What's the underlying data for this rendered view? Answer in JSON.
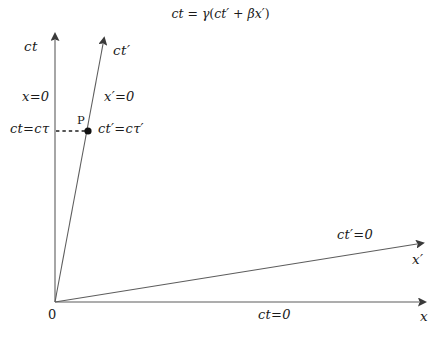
{
  "figure": {
    "title_equation": "ct = γ(ct′ + βx′)",
    "title_parts": {
      "lhs": "ct",
      "equals": "=",
      "gamma": "γ",
      "open": "(",
      "ctp": "ct′",
      "plus": "+",
      "beta": "β",
      "xp": "x′",
      "close": ")"
    },
    "background_color": "#ffffff",
    "line_color": "#555555",
    "text_color": "#1a1a1a"
  },
  "axes": {
    "ct": {
      "label": "ct",
      "region_label": "x=0",
      "origin": [
        55,
        302
      ],
      "tip": [
        55,
        36
      ]
    },
    "ct_prime": {
      "label": "ct′",
      "region_label": "x′=0",
      "origin": [
        55,
        302
      ],
      "tip": [
        104,
        40
      ]
    },
    "x": {
      "label": "x",
      "region_label": "ct=0",
      "origin": [
        55,
        302
      ],
      "tip": [
        428,
        302
      ]
    },
    "x_prime": {
      "label": "x′",
      "region_label": "ct′=0",
      "origin": [
        55,
        302
      ],
      "tip": [
        426,
        243
      ]
    }
  },
  "annotations": {
    "origin": "0",
    "event_point": "P",
    "event_point_coords": [
      88,
      131
    ],
    "ct_value_label": "ct=cτ",
    "ct_prime_value_label": "ct′=cτ′",
    "dashed_connector": {
      "from": [
        56,
        131
      ],
      "to": [
        88,
        131
      ]
    }
  }
}
